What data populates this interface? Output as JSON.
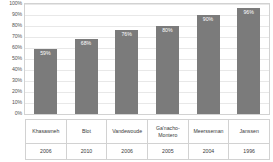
{
  "chart_data": {
    "type": "bar",
    "title": "",
    "subtitle": "",
    "xlabel": "",
    "ylabel": "",
    "ylim": [
      0,
      100
    ],
    "grid": true,
    "legend": false,
    "orientation": "vertical",
    "bar_color": "#7b7b7b",
    "categories": [
      "Khasawneh",
      "Blot",
      "Vandewoude",
      "Ga'nacho-Montero",
      "Meersseman",
      "Janssen"
    ],
    "years": [
      "2006",
      "2010",
      "2006",
      "2005",
      "2004",
      "1996"
    ],
    "values": [
      59,
      68,
      76,
      80,
      90,
      96
    ],
    "data_labels": [
      "59%",
      "68%",
      "76%",
      "80%",
      "90%",
      "96%"
    ],
    "ytick_labels": [
      "100%",
      "90%",
      "80%",
      "70%",
      "60%",
      "50%",
      "40%",
      "30%",
      "20%",
      "10%",
      "0%"
    ],
    "ytick_values": [
      100,
      90,
      80,
      70,
      60,
      50,
      40,
      30,
      20,
      10,
      0
    ]
  },
  "bars": [
    {
      "label": "Khasawneh",
      "year": "2006",
      "value": 59,
      "value_label": "59%"
    },
    {
      "label": "Blot",
      "year": "2010",
      "value": 68,
      "value_label": "68%"
    },
    {
      "label": "Vandewoude",
      "year": "2006",
      "value": 76,
      "value_label": "76%"
    },
    {
      "label": "Ga'nacho-Montero",
      "year": "2005",
      "value": 80,
      "value_label": "80%"
    },
    {
      "label": "Meersseman",
      "year": "2004",
      "value": 90,
      "value_label": "90%"
    },
    {
      "label": "Janssen",
      "year": "1996",
      "value": 96,
      "value_label": "96%"
    }
  ]
}
